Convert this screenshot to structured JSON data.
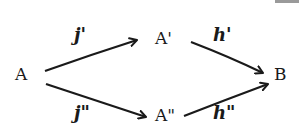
{
  "diagram": {
    "type": "commutative-diagram",
    "nodes": {
      "A": "A",
      "A_prime": "A'",
      "A_double_prime": "A\"",
      "B": "B"
    },
    "arrows": {
      "j_prime": "j'",
      "j_double_prime": "j\"",
      "h_prime": "h'",
      "h_double_prime": "h\""
    },
    "edges": [
      {
        "from": "A",
        "to": "A'",
        "label": "j'"
      },
      {
        "from": "A",
        "to": "A\"",
        "label": "j\""
      },
      {
        "from": "A'",
        "to": "B",
        "label": "h'"
      },
      {
        "from": "A\"",
        "to": "B",
        "label": "h\""
      }
    ],
    "colors": {
      "ink": "#1a1a1a",
      "background": "#ffffff"
    }
  }
}
